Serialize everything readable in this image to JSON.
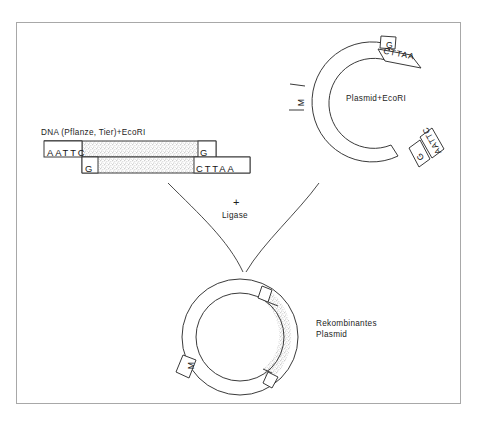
{
  "figure": {
    "caption": ""
  },
  "dna_fragment": {
    "label": "DNA (Pflanze, Tier)+EcoRI",
    "top_strand_left": "AATTC",
    "bottom_strand_left": "G",
    "top_strand_right": "G",
    "bottom_strand_right": "CTTAA"
  },
  "plasmid": {
    "label": "Plasmid+EcoRI",
    "marker_label": "M",
    "sticky_end_top_upper": "G",
    "sticky_end_top_lower": "CTTAA",
    "sticky_end_bottom_upper": "AATTC",
    "sticky_end_bottom_lower": "G"
  },
  "reaction": {
    "plus": "+",
    "enzyme": "Ligase"
  },
  "recombinant": {
    "label_line1": "Rekombinantes",
    "label_line2": "Plasmid",
    "marker_label": "M"
  },
  "colors": {
    "frame": "#a8a8a8",
    "stroke": "#3a3a3a",
    "text": "#1a1a1a",
    "stipple": "#d9d9d9",
    "background": "#ffffff"
  }
}
